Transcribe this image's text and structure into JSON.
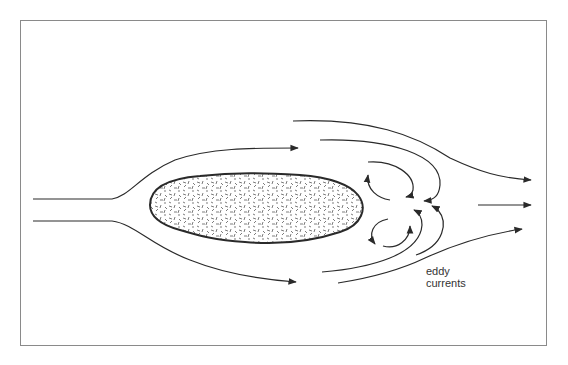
{
  "diagram": {
    "labels": {
      "eddy_line1": "eddy",
      "eddy_line2": "currents"
    },
    "elements": {
      "obstacle": "stippled elongated body (rock/island)",
      "streamlines": [
        "upper deflected streamline",
        "lower deflected streamline",
        "upper outer wake streamline",
        "upper inner wake curve",
        "lower inner wake curve",
        "lower outer wake streamline",
        "center downstream arrow"
      ],
      "eddies": [
        "upper eddy loop",
        "lower eddy loop"
      ]
    },
    "colors": {
      "line": "#2a2a2a",
      "frame": "#8a8a8a",
      "background": "#ffffff"
    }
  }
}
